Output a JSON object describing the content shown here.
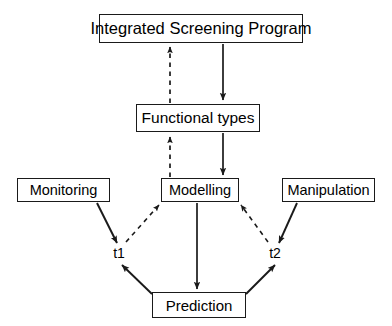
{
  "diagram": {
    "background_color": "#ffffff",
    "line_color": "#1a1a1a",
    "text_color": "#000000",
    "nodes": [
      {
        "id": "integrated-screening-program",
        "label": "Integrated Screening Program",
        "shape": "rectangle"
      },
      {
        "id": "functional-types",
        "label": "Functional types",
        "shape": "rectangle"
      },
      {
        "id": "monitoring",
        "label": "Monitoring",
        "shape": "rectangle"
      },
      {
        "id": "modelling",
        "label": "Modelling",
        "shape": "rectangle"
      },
      {
        "id": "manipulation",
        "label": "Manipulation",
        "shape": "rectangle"
      },
      {
        "id": "prediction",
        "label": "Prediction",
        "shape": "rectangle"
      },
      {
        "id": "t1",
        "label": "t1",
        "shape": "plain-text"
      },
      {
        "id": "t2",
        "label": "t2",
        "shape": "plain-text"
      }
    ],
    "edges": [
      {
        "id": "edge-functional-types-to-integrated-screening-program",
        "from": "functional-types",
        "to": "integrated-screening-program",
        "style": "dashed",
        "arrow": "single",
        "direction": "up"
      },
      {
        "id": "edge-integrated-screening-program-to-functional-types",
        "from": "integrated-screening-program",
        "to": "functional-types",
        "style": "solid",
        "arrow": "single",
        "direction": "down"
      },
      {
        "id": "edge-modelling-to-functional-types",
        "from": "modelling",
        "to": "functional-types",
        "style": "dashed",
        "arrow": "single",
        "direction": "up"
      },
      {
        "id": "edge-functional-types-to-modelling",
        "from": "functional-types",
        "to": "modelling",
        "style": "solid",
        "arrow": "single",
        "direction": "down"
      },
      {
        "id": "edge-monitoring-to-t1",
        "from": "monitoring",
        "to": "t1",
        "style": "solid",
        "arrow": "single",
        "direction": "down-right"
      },
      {
        "id": "edge-t1-to-modelling",
        "from": "t1",
        "to": "modelling",
        "style": "dashed",
        "arrow": "single",
        "direction": "up-right"
      },
      {
        "id": "edge-manipulation-to-t2",
        "from": "manipulation",
        "to": "t2",
        "style": "solid",
        "arrow": "single",
        "direction": "down-left"
      },
      {
        "id": "edge-t2-to-modelling",
        "from": "t2",
        "to": "modelling",
        "style": "dashed",
        "arrow": "single",
        "direction": "up-left"
      },
      {
        "id": "edge-modelling-to-prediction",
        "from": "modelling",
        "to": "prediction",
        "style": "solid",
        "arrow": "single",
        "direction": "down"
      },
      {
        "id": "edge-prediction-to-t1",
        "from": "prediction",
        "to": "t1",
        "style": "solid",
        "arrow": "single",
        "direction": "up-left"
      },
      {
        "id": "edge-prediction-to-t2",
        "from": "prediction",
        "to": "t2",
        "style": "solid",
        "arrow": "single",
        "direction": "up-right"
      }
    ]
  }
}
